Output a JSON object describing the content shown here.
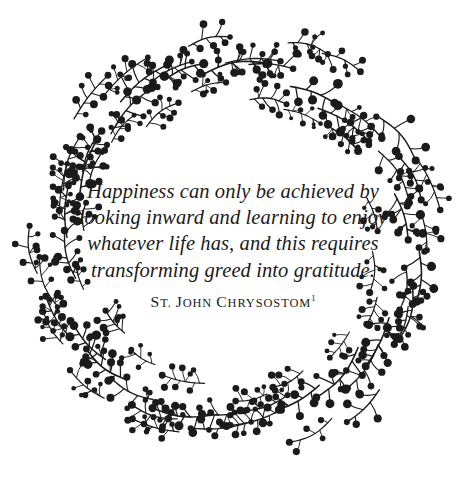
{
  "page": {
    "background_color": "#ffffff",
    "ink_color": "#1b1b1b",
    "width": 466,
    "height": 485
  },
  "quote": {
    "lines": [
      "Happiness can only be achieved by",
      "looking inward and learning to enjoy",
      "whatever life has, and this requires",
      "transforming greed into gratitude."
    ],
    "full_text": "Happiness can only be achieved by looking inward and learning to enjoy whatever life has, and this requires transforming greed into gratitude."
  },
  "attribution": {
    "prefix_cap": "S",
    "prefix_rest": "T.",
    "given_cap": "J",
    "given_rest": "OHN",
    "family_cap": "C",
    "family_rest": "HRYSOSTOM",
    "display_text": "St. John Chrysostom",
    "footnote_marker": "1"
  },
  "ornament": {
    "name": "berry-sprig-wreath",
    "center_x": 232,
    "center_y": 242,
    "outer_radius": 214,
    "inner_radius": 139,
    "stroke_color": "#1b1b1b",
    "berry_color": "#1b1b1b",
    "branch_count": 26,
    "seed": 20240607
  }
}
